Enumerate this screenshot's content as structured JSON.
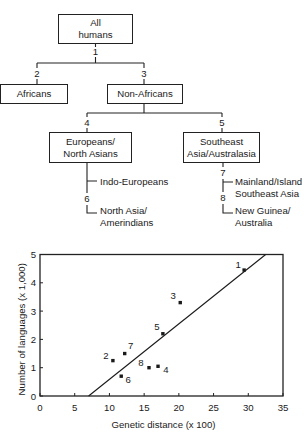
{
  "tree": {
    "nodes": {
      "all_humans": {
        "line1": "All",
        "line2": "humans"
      },
      "africans": {
        "label": "Africans"
      },
      "non_africans": {
        "label": "Non-Africans"
      },
      "europeans": {
        "line1": "Europeans/",
        "line2": "North Asians"
      },
      "southeast": {
        "line1": "Southeast",
        "line2": "Asia/Australasia"
      }
    },
    "branch_numbers": {
      "b1": "1",
      "b2": "2",
      "b3": "3",
      "b4": "4",
      "b5": "5",
      "b6": "6",
      "b7": "7",
      "b8": "8"
    },
    "leaves": {
      "indo_europeans": "Indo-Europeans",
      "north_asia": {
        "line1": "North Asia/",
        "line2": "Amerindians"
      },
      "mainland": {
        "line1": "Mainland/Island",
        "line2": "Southeast Asia"
      },
      "new_guinea": {
        "line1": "New Guinea/",
        "line2": "Australia"
      }
    }
  },
  "chart_data": {
    "type": "scatter",
    "title": "",
    "xlabel": "Genetic distance (x 100)",
    "ylabel": "Number of languages (x 1,000)",
    "xlim": [
      0,
      35
    ],
    "ylim": [
      0,
      5
    ],
    "xticks": [
      0,
      5,
      10,
      15,
      20,
      25,
      30,
      35
    ],
    "yticks": [
      0,
      1,
      2,
      3,
      4,
      5
    ],
    "grid": false,
    "legend": null,
    "points": [
      {
        "label": "1",
        "x": 29.4,
        "y": 4.45,
        "label_dx": -6,
        "label_dy": -2
      },
      {
        "label": "2",
        "x": 10.5,
        "y": 1.25,
        "label_dx": -7,
        "label_dy": -2
      },
      {
        "label": "3",
        "x": 20.2,
        "y": 3.3,
        "label_dx": -7,
        "label_dy": -4
      },
      {
        "label": "4",
        "x": 17.0,
        "y": 1.05,
        "label_dx": 8,
        "label_dy": 7
      },
      {
        "label": "5",
        "x": 17.7,
        "y": 2.2,
        "label_dx": -6,
        "label_dy": -4
      },
      {
        "label": "6",
        "x": 11.7,
        "y": 0.7,
        "label_dx": 7,
        "label_dy": 7
      },
      {
        "label": "7",
        "x": 12.2,
        "y": 1.5,
        "label_dx": 6,
        "label_dy": -5
      },
      {
        "label": "8",
        "x": 15.7,
        "y": 1.0,
        "label_dx": -8,
        "label_dy": -2
      }
    ],
    "fit_line": {
      "x": [
        7.0,
        32.5
      ],
      "y": [
        0,
        5
      ]
    },
    "colors": {
      "marker": "#1a1a1a",
      "line": "#1a1a1a",
      "frame": "#222222"
    }
  }
}
